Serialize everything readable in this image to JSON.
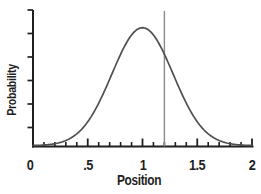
{
  "chart_data": {
    "type": "line",
    "title": "",
    "xlabel": "Position",
    "ylabel": "Probability",
    "xlim": [
      0,
      2
    ],
    "grid": false,
    "legend": false,
    "x_axis": {
      "major_ticks": [
        0,
        0.5,
        1,
        1.5,
        2
      ],
      "major_tick_labels": [
        "0",
        ".5",
        "1",
        "1.5",
        "2"
      ],
      "minor_tick_step": 0.1,
      "tick_direction": "in"
    },
    "y_axis": {
      "tick_count": 6,
      "tick_labels_shown": false,
      "tick_direction": "out"
    },
    "series": [
      {
        "name": "normal-distribution-curve",
        "shape": "gaussian",
        "mean": 1.0,
        "sigma": 0.28,
        "peak": 1.0,
        "color": "#4f4f4f",
        "points": [
          [
            0.0,
            0.002
          ],
          [
            0.1,
            0.006
          ],
          [
            0.2,
            0.017
          ],
          [
            0.3,
            0.044
          ],
          [
            0.4,
            0.101
          ],
          [
            0.5,
            0.203
          ],
          [
            0.6,
            0.36
          ],
          [
            0.7,
            0.563
          ],
          [
            0.8,
            0.775
          ],
          [
            0.9,
            0.938
          ],
          [
            1.0,
            1.0
          ],
          [
            1.1,
            0.938
          ],
          [
            1.2,
            0.775
          ],
          [
            1.3,
            0.563
          ],
          [
            1.4,
            0.36
          ],
          [
            1.5,
            0.203
          ],
          [
            1.6,
            0.101
          ],
          [
            1.7,
            0.044
          ],
          [
            1.8,
            0.017
          ],
          [
            1.9,
            0.006
          ],
          [
            2.0,
            0.002
          ]
        ]
      }
    ],
    "annotations": [
      {
        "type": "vline",
        "x": 1.2,
        "color": "#8a8a8a"
      }
    ],
    "colors": {
      "axis": "#1f1f1f",
      "text": "#1f1f1f",
      "background": "#ffffff"
    }
  }
}
